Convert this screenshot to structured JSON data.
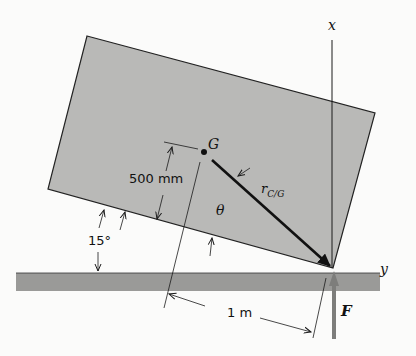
{
  "figure": {
    "type": "rigid-body free-body diagram",
    "labels": {
      "x_axis": "x",
      "y_axis": "y",
      "center_of_mass": "G",
      "position_vector": "r",
      "position_vector_subscript": "C/G",
      "angle_theta": "θ",
      "height_dim": "500 mm",
      "tilt_angle": "15°",
      "horizontal_dim": "1 m",
      "force": "F"
    },
    "colors": {
      "body_fill": "#b9b9b7",
      "ground_fill": "#9a9a98",
      "force_arrow": "#7d7d7b",
      "line": "#1a1a1a",
      "background": "#fbfbfa"
    }
  }
}
